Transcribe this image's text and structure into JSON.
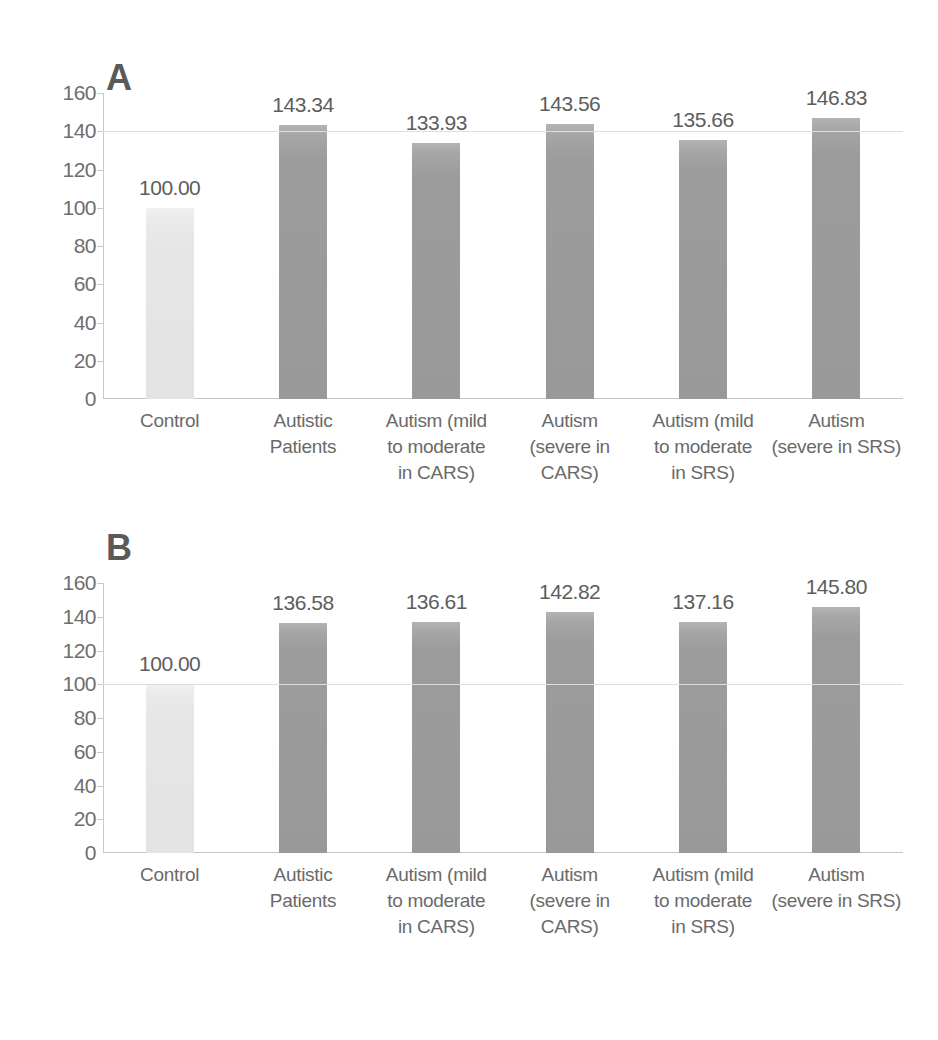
{
  "figure": {
    "background": "#ffffff",
    "bar_color_control": "#e3e3e3",
    "bar_color_patient": "#999999",
    "text_color": "#6a6a6a"
  },
  "chart_data": [
    {
      "type": "bar",
      "panel": "A",
      "title": "A",
      "xlabel": "",
      "ylabel": "",
      "ylim": [
        0,
        160
      ],
      "yticks": [
        0,
        20,
        40,
        60,
        80,
        100,
        120,
        140,
        160
      ],
      "ytick_labels": [
        "0",
        "20",
        "40",
        "60",
        "80",
        "100",
        "120",
        "140",
        "160"
      ],
      "grid": true,
      "gridlines_at": [
        140
      ],
      "legend": "none",
      "categories": [
        "Control",
        "Autistic Patients",
        "Autism (mild to moderate in CARS)",
        "Autism (severe in CARS)",
        "Autism (mild to moderate in SRS)",
        "Autism (severe in SRS)"
      ],
      "category_lines": [
        [
          "Control"
        ],
        [
          "Autistic",
          "Patients"
        ],
        [
          "Autism (mild",
          "to moderate",
          "in CARS)"
        ],
        [
          "Autism",
          "(severe in",
          "CARS)"
        ],
        [
          "Autism (mild",
          "to moderate",
          "in SRS)"
        ],
        [
          "Autism",
          "(severe in SRS)"
        ]
      ],
      "values": [
        100.0,
        143.34,
        133.93,
        143.56,
        135.66,
        146.83
      ],
      "value_labels": [
        "100.00",
        "143.34",
        "133.93",
        "143.56",
        "135.66",
        "146.83"
      ],
      "bar_styles": [
        "light",
        "dark",
        "dark",
        "dark",
        "dark",
        "dark"
      ]
    },
    {
      "type": "bar",
      "panel": "B",
      "title": "B",
      "xlabel": "",
      "ylabel": "",
      "ylim": [
        0,
        160
      ],
      "yticks": [
        0,
        20,
        40,
        60,
        80,
        100,
        120,
        140,
        160
      ],
      "ytick_labels": [
        "0",
        "20",
        "40",
        "60",
        "80",
        "100",
        "120",
        "140",
        "160"
      ],
      "grid": true,
      "gridlines_at": [
        100
      ],
      "legend": "none",
      "categories": [
        "Control",
        "Autistic Patients",
        "Autism (mild to moderate in CARS)",
        "Autism (severe in CARS)",
        "Autism (mild to moderate in SRS)",
        "Autism (severe in SRS)"
      ],
      "category_lines": [
        [
          "Control"
        ],
        [
          "Autistic",
          "Patients"
        ],
        [
          "Autism (mild",
          "to moderate",
          "in CARS)"
        ],
        [
          "Autism",
          "(severe in",
          "CARS)"
        ],
        [
          "Autism (mild",
          "to moderate",
          "in SRS)"
        ],
        [
          "Autism",
          "(severe in SRS)"
        ]
      ],
      "values": [
        100.0,
        136.58,
        136.61,
        142.82,
        137.16,
        145.8
      ],
      "value_labels": [
        "100.00",
        "136.58",
        "136.61",
        "142.82",
        "137.16",
        "145.80"
      ],
      "bar_styles": [
        "light",
        "dark",
        "dark",
        "dark",
        "dark",
        "dark"
      ]
    }
  ]
}
